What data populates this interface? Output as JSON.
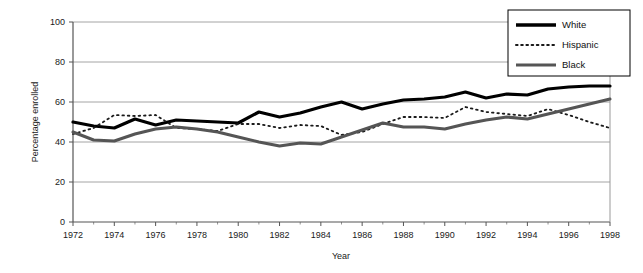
{
  "chart_data": {
    "type": "line",
    "title": "",
    "xlabel": "Year",
    "ylabel": "Percentage enrolled",
    "xlim": [
      1972,
      1998
    ],
    "ylim": [
      0,
      100
    ],
    "grid": true,
    "grid_axis": "y",
    "legend_position": "top-right",
    "x": [
      1972,
      1973,
      1974,
      1975,
      1976,
      1977,
      1978,
      1979,
      1980,
      1981,
      1982,
      1983,
      1984,
      1985,
      1986,
      1987,
      1988,
      1989,
      1990,
      1991,
      1992,
      1993,
      1994,
      1995,
      1996,
      1997,
      1998
    ],
    "xticks": [
      1972,
      1974,
      1976,
      1978,
      1980,
      1982,
      1984,
      1986,
      1988,
      1990,
      1992,
      1994,
      1996,
      1998
    ],
    "xtick_labels": [
      "1972",
      "1974",
      "1976",
      "1978",
      "1980",
      "1982",
      "1984",
      "1986",
      "1988",
      "1990",
      "1992",
      "1994",
      "1996",
      "1998"
    ],
    "yticks": [
      0,
      20,
      40,
      60,
      80,
      100
    ],
    "ytick_labels": [
      "0",
      "20",
      "40",
      "60",
      "80",
      "100"
    ],
    "series": [
      {
        "name": "White",
        "style": "solid",
        "color": "#000000",
        "width": 3.2,
        "values": [
          50,
          48,
          47,
          51.5,
          48.5,
          51,
          50.5,
          50,
          49.5,
          55,
          52.5,
          54.5,
          57.5,
          60,
          56.5,
          59,
          61,
          61.5,
          62.5,
          65,
          62,
          64,
          63.5,
          66.5,
          67.5,
          68,
          68
        ]
      },
      {
        "name": "Hispanic",
        "style": "dotted",
        "color": "#1a1a1a",
        "width": 1.8,
        "values": [
          44,
          47,
          53.5,
          53,
          53.5,
          47,
          46.5,
          45.5,
          49,
          49,
          47,
          48.5,
          48,
          43.5,
          45,
          49,
          52.5,
          52.5,
          52,
          57.5,
          55,
          54,
          53,
          56.5,
          53.5,
          50,
          47
        ]
      },
      {
        "name": "Black",
        "style": "solid",
        "color": "#555555",
        "width": 3.0,
        "values": [
          45,
          41,
          40.5,
          44,
          46.5,
          47.5,
          46.5,
          45,
          42.5,
          40,
          38,
          39.5,
          39,
          42.5,
          46,
          49.5,
          47.5,
          47.5,
          46.5,
          49,
          51,
          52.5,
          51.5,
          54,
          56.5,
          59,
          61.5
        ]
      }
    ]
  },
  "legend": {
    "entries": [
      {
        "label": "White"
      },
      {
        "label": "Hispanic"
      },
      {
        "label": "Black"
      }
    ]
  },
  "axes": {
    "x_title": "Year",
    "y_title": "Percentage enrolled"
  }
}
